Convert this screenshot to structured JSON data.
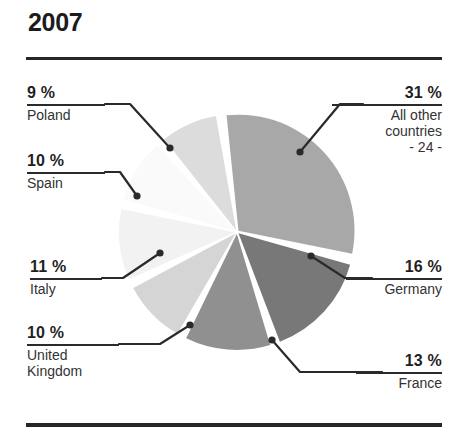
{
  "chart_data": {
    "type": "pie",
    "title": "2007",
    "xlabel": "",
    "ylabel": "",
    "unit": "%",
    "grid": false,
    "legend": "none",
    "labels_position": "callout-leader-lines",
    "categories": [
      "All other countries",
      "Germany",
      "France",
      "United Kingdom",
      "Italy",
      "Spain",
      "Poland"
    ],
    "values": [
      31,
      16,
      13,
      10,
      11,
      10,
      9
    ],
    "annotations": [
      "- 24 -"
    ],
    "slices": [
      {
        "name": "All other countries",
        "value": 31,
        "pct_label": "31 %",
        "name_label": "All other\ncountries",
        "sub_label": "- 24 -",
        "color": "#a8a8a8",
        "start_angle": -8,
        "end_angle": 103.6
      },
      {
        "name": "Germany",
        "value": 16,
        "pct_label": "16 %",
        "name_label": "Germany",
        "color": "#787878",
        "start_angle": 103.6,
        "end_angle": 161.2
      },
      {
        "name": "France",
        "value": 13,
        "pct_label": "13 %",
        "name_label": "France",
        "color": "#909090",
        "start_angle": 161.2,
        "end_angle": 208
      },
      {
        "name": "United Kingdom",
        "value": 10,
        "pct_label": "10 %",
        "name_label": "United\nKingdom",
        "color": "#d5d5d5",
        "start_angle": 208,
        "end_angle": 244
      },
      {
        "name": "Italy",
        "value": 11,
        "pct_label": "11 %",
        "name_label": "Italy",
        "color": "#f2f2f2",
        "start_angle": 244,
        "end_angle": 283.6
      },
      {
        "name": "Spain",
        "value": 10,
        "pct_label": "10 %",
        "name_label": "Spain",
        "color": "#fafafa",
        "start_angle": 283.6,
        "end_angle": 319.6
      },
      {
        "name": "Poland",
        "value": 9,
        "pct_label": "9 %",
        "name_label": "Poland",
        "color": "#dcdcdc",
        "start_angle": 319.6,
        "end_angle": 352
      }
    ],
    "colors": {
      "all_other_countries": "#a8a8a8",
      "germany": "#787878",
      "france": "#909090",
      "united_kingdom": "#d5d5d5",
      "italy": "#f2f2f2",
      "spain": "#fafafa",
      "poland": "#dcdcdc",
      "rule": "#262626",
      "text": "#1f1f1f",
      "background": "#ffffff"
    }
  },
  "labels": {
    "poland": {
      "pct": "9 %",
      "name": "Poland"
    },
    "spain": {
      "pct": "10 %",
      "name": "Spain"
    },
    "italy": {
      "pct": "11 %",
      "name": "Italy"
    },
    "uk": {
      "pct": "10 %",
      "name": "United\nKingdom"
    },
    "other": {
      "pct": "31 %",
      "name": "All other\ncountries\n- 24 -"
    },
    "germany": {
      "pct": "16 %",
      "name": "Germany"
    },
    "france": {
      "pct": "13 %",
      "name": "France"
    }
  }
}
